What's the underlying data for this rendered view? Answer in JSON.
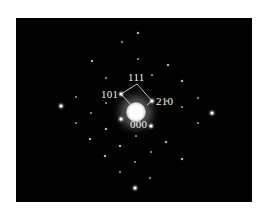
{
  "figure": {
    "type": "selected-area electron diffraction pattern",
    "background_color": "#020202",
    "spot_color": "#ffffff",
    "labels": {
      "top": "111",
      "left": "101",
      "right": "210",
      "center": "000"
    },
    "spots": [
      {
        "x": 138,
        "y": 33,
        "size": "s2"
      },
      {
        "x": 122,
        "y": 42,
        "size": "s3"
      },
      {
        "x": 92,
        "y": 61,
        "size": "s2"
      },
      {
        "x": 138,
        "y": 59,
        "size": "s3"
      },
      {
        "x": 168,
        "y": 65,
        "size": "s2"
      },
      {
        "x": 106,
        "y": 78,
        "size": "s3"
      },
      {
        "x": 152,
        "y": 75,
        "size": "s3"
      },
      {
        "x": 182,
        "y": 81,
        "size": "s2"
      },
      {
        "x": 121,
        "y": 94,
        "size": "s1"
      },
      {
        "x": 152,
        "y": 101,
        "size": "s1"
      },
      {
        "x": 61,
        "y": 106,
        "size": "s1"
      },
      {
        "x": 212,
        "y": 113,
        "size": "s1"
      },
      {
        "x": 91,
        "y": 113,
        "size": "s3"
      },
      {
        "x": 106,
        "y": 103,
        "size": "s3"
      },
      {
        "x": 167,
        "y": 101,
        "size": "s3"
      },
      {
        "x": 182,
        "y": 107,
        "size": "s3"
      },
      {
        "x": 198,
        "y": 98,
        "size": "s3"
      },
      {
        "x": 76,
        "y": 123,
        "size": "s3"
      },
      {
        "x": 121,
        "y": 119,
        "size": "s1"
      },
      {
        "x": 151,
        "y": 126,
        "size": "s1"
      },
      {
        "x": 198,
        "y": 123,
        "size": "s3"
      },
      {
        "x": 106,
        "y": 129,
        "size": "s2"
      },
      {
        "x": 136,
        "y": 136,
        "size": "s3"
      },
      {
        "x": 90,
        "y": 139,
        "size": "s2"
      },
      {
        "x": 166,
        "y": 142,
        "size": "s2"
      },
      {
        "x": 120,
        "y": 146,
        "size": "s2"
      },
      {
        "x": 105,
        "y": 156,
        "size": "s2"
      },
      {
        "x": 151,
        "y": 152,
        "size": "s3"
      },
      {
        "x": 182,
        "y": 159,
        "size": "s2"
      },
      {
        "x": 135,
        "y": 162,
        "size": "s3"
      },
      {
        "x": 120,
        "y": 172,
        "size": "s3"
      },
      {
        "x": 150,
        "y": 178,
        "size": "s3"
      },
      {
        "x": 135,
        "y": 188,
        "size": "s1"
      },
      {
        "x": 76,
        "y": 97,
        "size": "s3"
      }
    ]
  }
}
